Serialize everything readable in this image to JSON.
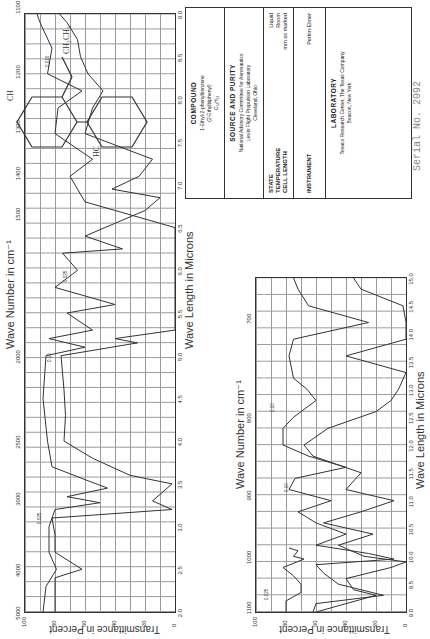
{
  "page": {
    "serial_label": "Serial No. 2092",
    "top_axis_title": "Wave Number in cm⁻¹",
    "bottom_axis_title": "Wave Length in Microns",
    "y_axis_title": "Transmittance in Percent"
  },
  "info": {
    "compound_header": "COMPOUND",
    "compound_name": "1-Ethyl-2-phenylbenzene",
    "compound_alt": "(2-Ethylbiphenyl)",
    "compound_formula": "C₁₄H₁₄",
    "source_header": "SOURCE AND PURITY",
    "source_line1": "National Advisory Committee for Aeronautics",
    "source_line2": "Lewis Flight Propulsion Laboratory",
    "source_line3": "Cleveland, Ohio",
    "state_label": "STATE",
    "state_value": "Liquid",
    "temp_label": "TEMPERATURE",
    "temp_value": "Room",
    "cell_label": "CELL LENGTH",
    "cell_value": "mm as marked",
    "instrument_label": "INSTRUMENT",
    "instrument_value": "Perkin-Elmer",
    "lab_header": "LABORATORY",
    "lab_line1": "Texaco Research Center, The Texas Company",
    "lab_line2": "Beacon, New York"
  },
  "structure": {
    "substituent": "CH₂CH₃",
    "atoms": [
      "HC",
      "C",
      "C",
      "CH",
      "H",
      "H",
      "H",
      "H"
    ]
  },
  "chart_data": [
    {
      "type": "line",
      "title": "IR spectrum 2.0–9.0 µm",
      "xlabel": "Wave Length in Microns",
      "x2label": "Wave Number in cm⁻¹",
      "ylabel": "Transmittance in Percent",
      "xlim": [
        2.0,
        9.0
      ],
      "ylim": [
        0,
        100
      ],
      "grid": true,
      "x_ticks": [
        "2.0",
        "2.5",
        "3.0",
        "3.5",
        "4.0",
        "4.5",
        "5.0",
        "5.5",
        "6.0",
        "6.5",
        "7.0",
        "7.5",
        "8.0",
        "8.5",
        "9.0"
      ],
      "x2_ticks": [
        "5000",
        "4000",
        "3000",
        "2500",
        "2000",
        "1500",
        "1400",
        "1300",
        "1200",
        "1100"
      ],
      "y_ticks": [
        "0",
        "20",
        "40",
        "60",
        "80",
        "100"
      ],
      "annotations": [
        "0.025",
        "0.10",
        "0.025",
        "0.010"
      ],
      "series": [
        {
          "name": "thin cell",
          "x": [
            2.0,
            2.3,
            2.5,
            2.7,
            3.0,
            3.2,
            3.28,
            3.35,
            3.45,
            3.55,
            3.7,
            4.0,
            4.5,
            5.0,
            5.1,
            5.2,
            5.3,
            5.5,
            5.6,
            5.8,
            6.0,
            6.2,
            6.25,
            6.4,
            6.7,
            6.85,
            6.95,
            7.1,
            7.3,
            7.6,
            7.9,
            8.1,
            8.3,
            8.5,
            8.7,
            8.9,
            9.0
          ],
          "y": [
            88,
            86,
            79,
            84,
            84,
            80,
            50,
            72,
            45,
            60,
            82,
            85,
            88,
            86,
            60,
            84,
            55,
            72,
            40,
            80,
            65,
            75,
            35,
            60,
            20,
            10,
            42,
            24,
            15,
            60,
            55,
            48,
            58,
            63,
            65,
            72,
            77
          ]
        },
        {
          "name": "thick cell",
          "x": [
            2.0,
            2.4,
            2.5,
            2.7,
            2.9,
            3.1,
            3.2,
            3.3,
            3.5,
            3.6,
            3.8,
            4.0,
            4.3,
            4.6,
            5.0,
            5.15,
            5.2,
            5.3,
            5.5,
            6.5,
            6.55,
            6.8,
            7.1,
            7.3,
            7.6,
            7.9,
            8.1,
            8.3,
            8.6,
            8.9,
            9.0
          ],
          "y": [
            80,
            80,
            62,
            80,
            80,
            82,
            2,
            15,
            2,
            30,
            55,
            74,
            73,
            74,
            76,
            25,
            40,
            0,
            0,
            0,
            10,
            60,
            70,
            55,
            80,
            78,
            62,
            85,
            82,
            90,
            92
          ]
        }
      ]
    },
    {
      "type": "line",
      "title": "IR spectrum 9.0–15.0 µm",
      "xlabel": "Wave Length in Microns",
      "x2label": "Wave Number in cm⁻¹",
      "ylabel": "Transmittance in Percent",
      "xlim": [
        9.0,
        15.0
      ],
      "ylim": [
        0,
        100
      ],
      "grid": true,
      "x_ticks": [
        "9.0",
        "9.5",
        "10.0",
        "10.5",
        "11.0",
        "11.5",
        "12.0",
        "12.5",
        "13.0",
        "13.5",
        "14.0",
        "14.5",
        "15.0"
      ],
      "x2_ticks": [
        "1100",
        "1000",
        "900",
        "800",
        "700"
      ],
      "y_ticks": [
        "0",
        "20",
        "40",
        "60",
        "80",
        "100"
      ],
      "annotations": [
        "0.025",
        "0.10",
        "0.10"
      ],
      "series": [
        {
          "name": "thin cell",
          "x": [
            9.0,
            9.2,
            9.35,
            9.5,
            9.65,
            9.8,
            9.95,
            10.0,
            10.1,
            10.15
          ],
          "y": [
            80,
            80,
            70,
            70,
            75,
            82,
            68,
            75,
            72,
            78
          ]
        },
        {
          "name": "medium cell",
          "x": [
            9.0,
            9.15,
            9.3,
            9.5,
            9.7,
            9.85,
            9.95,
            10.05,
            10.2,
            10.4,
            10.6,
            10.8,
            11.0,
            11.2,
            11.4,
            11.6,
            11.8,
            12.0,
            12.3,
            12.5,
            12.8,
            13.0,
            13.2,
            13.6,
            13.9,
            14.2,
            14.5,
            14.8,
            15.0
          ],
          "y": [
            62,
            60,
            15,
            45,
            55,
            60,
            8,
            25,
            60,
            40,
            60,
            72,
            50,
            78,
            74,
            40,
            65,
            82,
            82,
            75,
            60,
            66,
            75,
            78,
            75,
            25,
            65,
            72,
            75
          ]
        },
        {
          "name": "thick cell",
          "x": [
            9.0,
            9.3,
            9.4,
            9.6,
            9.8,
            9.9,
            10.0,
            10.2,
            10.4,
            10.6,
            10.8,
            11.0,
            11.2,
            11.5,
            11.8,
            12.0,
            12.3,
            12.6,
            12.8,
            13.0,
            13.3,
            13.6,
            13.9,
            14.2,
            14.5,
            14.8,
            15.0
          ],
          "y": [
            60,
            20,
            35,
            40,
            10,
            0,
            28,
            45,
            22,
            55,
            30,
            8,
            40,
            30,
            62,
            68,
            52,
            20,
            10,
            5,
            0,
            40,
            0,
            0,
            2,
            30,
            35
          ]
        }
      ]
    }
  ]
}
